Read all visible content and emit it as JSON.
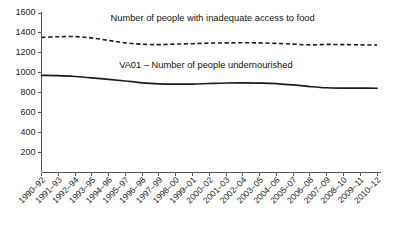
{
  "chart_data": {
    "type": "line",
    "title": "",
    "subtitle": "",
    "xlabel": "",
    "ylabel": "",
    "ylim": [
      0,
      1600
    ],
    "yticks": [
      200,
      400,
      600,
      800,
      1000,
      1200,
      1400,
      1600
    ],
    "grid": false,
    "legend_position": "inline-annotation",
    "categories": [
      "1990–92",
      "1991–93",
      "1992–94",
      "1993–95",
      "1994–96",
      "1995–97",
      "1996–98",
      "1997–99",
      "1998–00",
      "1999–01",
      "2000–02",
      "2001–03",
      "2002–04",
      "2003–05",
      "2004–06",
      "2005–07",
      "2006–08",
      "2007–09",
      "2008–10",
      "2009–11",
      "2010–12"
    ],
    "series": [
      {
        "name": "Number of people with inadequate access to food",
        "style": "dashed",
        "color": "#1c1c1c",
        "label_x_index": 10.2,
        "label_value": 1520,
        "values": [
          1355,
          1362,
          1363,
          1350,
          1325,
          1300,
          1287,
          1283,
          1288,
          1292,
          1298,
          1300,
          1302,
          1300,
          1295,
          1288,
          1280,
          1285,
          1283,
          1280,
          1278
        ]
      },
      {
        "name": "VA01 – Number of people undernourished",
        "style": "solid",
        "color": "#1c1c1c",
        "label_x_index": 9.8,
        "label_value": 1045,
        "values": [
          975,
          972,
          963,
          950,
          935,
          918,
          900,
          890,
          886,
          887,
          893,
          898,
          899,
          897,
          892,
          878,
          862,
          850,
          847,
          846,
          845
        ]
      }
    ]
  }
}
